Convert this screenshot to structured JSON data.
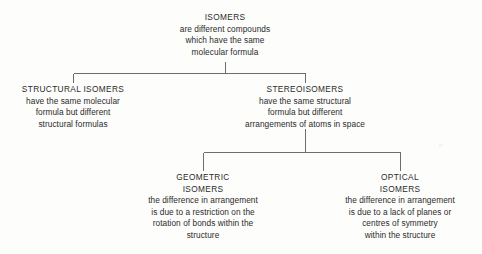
{
  "diagram": {
    "line_color": "#6e6e6e",
    "text_color": "#2b2b2b",
    "background_color": "#fdfdfb",
    "artifact_mark": "::"
  },
  "nodes": {
    "isomers": {
      "heading": "ISOMERS",
      "lines": [
        "are different compounds",
        "which have the same",
        "molecular formula"
      ]
    },
    "structural": {
      "heading": "STRUCTURAL ISOMERS",
      "lines": [
        "have the same molecular",
        "formula but different",
        "structural formulas"
      ]
    },
    "stereo": {
      "heading": "STEREOISOMERS",
      "lines": [
        "have the same structural",
        "formula but different",
        "arrangements of atoms in space"
      ]
    },
    "geometric": {
      "heading": "GEOMETRIC",
      "heading2": "ISOMERS",
      "lines": [
        "the difference in arrangement",
        "is due to a restriction on the",
        "rotation of bonds within the",
        "structure"
      ]
    },
    "optical": {
      "heading": "OPTICAL",
      "heading2": "ISOMERS",
      "lines": [
        "the difference in arrangement",
        "is due to a lack of planes or",
        "centres of symmetry",
        "within the structure"
      ]
    }
  }
}
